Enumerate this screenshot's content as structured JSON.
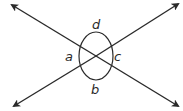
{
  "diagram": {
    "labels": {
      "top": "d",
      "left": "a",
      "right": "c",
      "bottom": "b"
    },
    "colors": {
      "line": "#2a2a2a",
      "background": "#ffffff"
    }
  }
}
